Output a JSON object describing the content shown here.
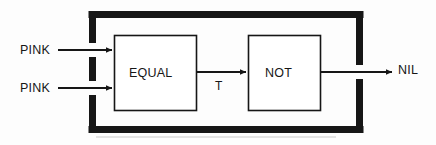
{
  "diagram": {
    "type": "block-diagram",
    "background_color": "#fdfdfd",
    "stroke_color": "#161616",
    "outer_block": {
      "name": "enclosing-module",
      "border_style": "thick",
      "border_thickness_px": 7,
      "bounds": {
        "x": 92,
        "y": 11,
        "width": 268,
        "height": 122
      },
      "gaps": [
        {
          "edge": "left",
          "for_signal": "PINK-1"
        },
        {
          "edge": "left",
          "for_signal": "PINK-2"
        },
        {
          "edge": "right",
          "for_signal": "NIL"
        }
      ]
    },
    "blocks": [
      {
        "id": "equal",
        "label": "EQUAL",
        "bounds": {
          "x": 114,
          "y": 35,
          "width": 82,
          "height": 75
        },
        "inputs": [
          "PINK",
          "PINK"
        ],
        "outputs": [
          "T"
        ]
      },
      {
        "id": "not",
        "label": "NOT",
        "bounds": {
          "x": 248,
          "y": 35,
          "width": 72,
          "height": 75
        },
        "inputs": [
          "T"
        ],
        "outputs": [
          "NIL"
        ]
      }
    ],
    "signals": [
      {
        "id": "in-1",
        "label": "PINK",
        "from": "external",
        "to": "equal",
        "y": 50
      },
      {
        "id": "in-2",
        "label": "PINK",
        "from": "external",
        "to": "equal",
        "y": 88
      },
      {
        "id": "mid",
        "label": "T",
        "from": "equal",
        "to": "not",
        "y": 72
      },
      {
        "id": "out",
        "label": "NIL",
        "from": "not",
        "to": "external",
        "y": 72
      }
    ],
    "labels": {
      "input_1": "PINK",
      "input_2": "PINK",
      "block_1": "EQUAL",
      "block_2": "NOT",
      "intermediate": "T",
      "output": "NIL"
    }
  }
}
